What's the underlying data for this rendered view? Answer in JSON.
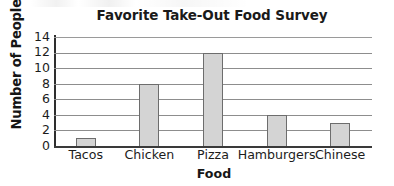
{
  "chart_data": {
    "type": "bar",
    "title": "Favorite Take-Out Food Survey",
    "xlabel": "Food",
    "ylabel": "Number of People",
    "categories": [
      "Tacos",
      "Chicken",
      "Pizza",
      "Hamburgers",
      "Chinese"
    ],
    "values": [
      1,
      8,
      12,
      4,
      3
    ],
    "ylim": [
      0,
      14
    ],
    "ytick_step": 2,
    "yticks": [
      0,
      2,
      4,
      6,
      8,
      10,
      12,
      14
    ],
    "ytick_labels": [
      "0",
      "2",
      "4",
      "6",
      "8",
      "10",
      "12",
      "14"
    ],
    "grid": true,
    "grid_axis": "y",
    "legend": false,
    "legend_position": "none",
    "bar_fill_color": "#d4d4d4",
    "bar_edge_color": "#6d6d6d",
    "axis_color": "#2e2e2e",
    "gridline_color": "#8d8d8d",
    "text_color": "#1c1c1c"
  }
}
